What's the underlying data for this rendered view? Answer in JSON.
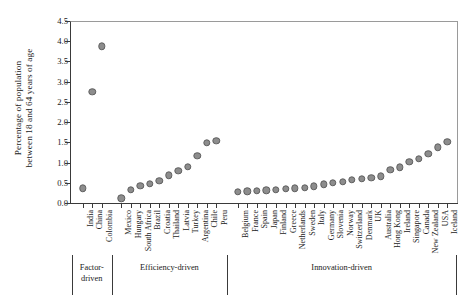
{
  "chart_data": {
    "type": "scatter",
    "title": "",
    "xlabel": "",
    "ylabel_lines": [
      "Percentage of population",
      "between 18 and 64 years of age"
    ],
    "ylabel": "Percentage of population between 18 and 64 years of age",
    "ylim": [
      0.0,
      4.5
    ],
    "yticks": [
      "0.0",
      "0.5",
      "1.0",
      "1.5",
      "2.0",
      "2.5",
      "3.0",
      "3.5",
      "4.0",
      "4.5"
    ],
    "ytick_values": [
      0.0,
      0.5,
      1.0,
      1.5,
      2.0,
      2.5,
      3.0,
      3.5,
      4.0,
      4.5
    ],
    "grid": false,
    "legend": "none",
    "marker_color": "#8d8d8d",
    "marker_edge_color": "#5f5f5f",
    "axis_color": "#3a3a3a",
    "categories": [
      "India",
      "China",
      "Colombia",
      "Mexico",
      "Hungary",
      "South Africa",
      "Brazil",
      "Croatia",
      "Thailand",
      "Latvia",
      "Turkey",
      "Argentina",
      "Chile",
      "Peru",
      "Belgium",
      "France",
      "Spain",
      "Japan",
      "Finland",
      "Greece",
      "Netherlands",
      "Sweden",
      "Italy",
      "Germany",
      "Slovenia",
      "Norway",
      "Switzerland",
      "Denmark",
      "UK",
      "Australia",
      "Hong Kong",
      "Ireland",
      "Singapore",
      "Canada",
      "New Zealand",
      "USA",
      "Iceland"
    ],
    "values": [
      0.36,
      2.75,
      3.87,
      0.12,
      0.33,
      0.42,
      0.47,
      0.55,
      0.68,
      0.8,
      0.9,
      1.16,
      1.49,
      1.54,
      0.28,
      0.29,
      0.3,
      0.31,
      0.33,
      0.35,
      0.36,
      0.38,
      0.41,
      0.46,
      0.5,
      0.53,
      0.57,
      0.6,
      0.63,
      0.66,
      0.82,
      0.88,
      1.02,
      1.1,
      1.22,
      1.38,
      1.52
    ],
    "extra_points": {
      "note": "Argentina/Chile/Peru cluster near 2.15 in Efficiency-driven tail",
      "chile": 2.15,
      "peru": 2.17
    },
    "groups": [
      {
        "name": "Factor-driven",
        "label_lines": [
          "Factor-",
          "driven"
        ],
        "start": 0,
        "end": 2
      },
      {
        "name": "Efficiency-driven",
        "label_lines": [
          "Efficiency-driven"
        ],
        "start": 3,
        "end": 13
      },
      {
        "name": "Innovation-driven",
        "label_lines": [
          "Innovation-driven"
        ],
        "start": 14,
        "end": 36
      }
    ]
  }
}
